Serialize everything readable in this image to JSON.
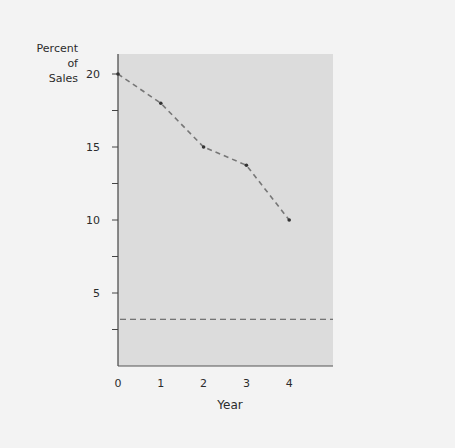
{
  "chart_data": {
    "type": "line",
    "title": "",
    "xlabel": "Year",
    "ylabel": "Percent of Sales",
    "ylabel_lines": [
      "Percent",
      "of",
      "Sales"
    ],
    "x": [
      0,
      1,
      2,
      3,
      4
    ],
    "x_tick_labels": [
      "0",
      "1",
      "2",
      "3",
      "4"
    ],
    "y_tick_labels": [
      "20",
      "15",
      "10",
      "5"
    ],
    "y_tick_values": [
      20,
      15,
      10,
      5
    ],
    "y_minor_ticks": [
      2.5,
      7.5,
      12.5,
      17.5
    ],
    "ylim": [
      0,
      22
    ],
    "xlim": [
      0,
      5
    ],
    "grid": false,
    "series": [
      {
        "name": "Percent of Sales",
        "values": [
          20,
          18,
          15,
          13.75,
          10
        ],
        "style": "dashed",
        "markers": true,
        "color": "#777777"
      }
    ],
    "reference_lines": [
      {
        "type": "horizontal",
        "value": 3.2,
        "style": "dashed",
        "color": "#555555"
      }
    ],
    "plot_background": "#dcdcdc"
  }
}
